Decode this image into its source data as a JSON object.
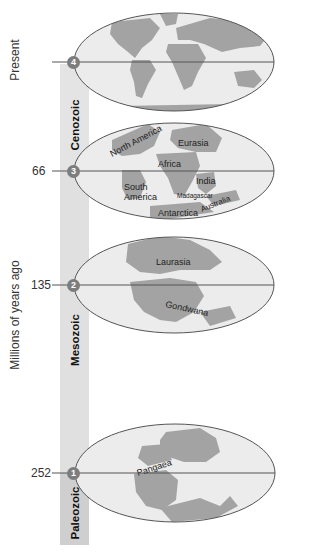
{
  "axis": {
    "title": "Millions of years ago",
    "present_label": "Present"
  },
  "eras": [
    {
      "name": "Cenozoic"
    },
    {
      "name": "Mesozoic"
    },
    {
      "name": "Paleozoic"
    }
  ],
  "time_markers": [
    {
      "number": "4",
      "age": "Present"
    },
    {
      "number": "3",
      "age": "66"
    },
    {
      "number": "2",
      "age": "135"
    },
    {
      "number": "1",
      "age": "252"
    }
  ],
  "globes": [
    {
      "stage": "4",
      "title": "Present-day continents",
      "labels": []
    },
    {
      "stage": "3",
      "labels": [
        "North America",
        "Eurasia",
        "Africa",
        "South America",
        "India",
        "Madagascar",
        "Australia",
        "Antarctica"
      ]
    },
    {
      "stage": "2",
      "labels": [
        "Laurasia",
        "Gondwana"
      ]
    },
    {
      "stage": "1",
      "labels": [
        "Pangaea"
      ]
    }
  ],
  "colors": {
    "ocean": "#ececec",
    "land": "#9a9a9a",
    "land_light": "#b5b5b5",
    "outline": "#555555",
    "marker": "#7d7d7d",
    "bar_cenozoic": "#e4e4e4",
    "bar_mesozoic": "#e0e0e0",
    "bar_paleozoic": "#cfcfcf"
  }
}
